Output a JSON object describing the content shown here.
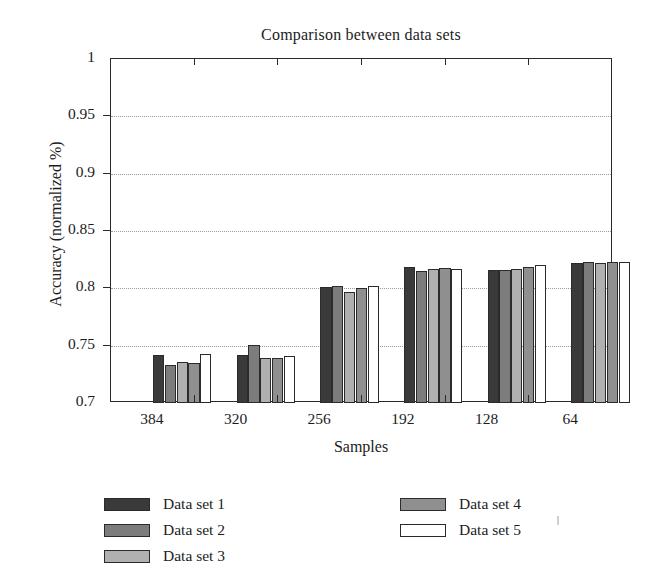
{
  "chart_data": {
    "type": "bar",
    "title": "Comparison between data sets",
    "xlabel": "Samples",
    "ylabel": "Accuracy (normalized %)",
    "categories": [
      "384",
      "320",
      "256",
      "192",
      "128",
      "64"
    ],
    "ylim": [
      0.7,
      1
    ],
    "yticks": [
      0.7,
      0.75,
      0.8,
      0.85,
      0.9,
      0.95,
      1
    ],
    "ytick_labels": [
      "0.7",
      "0.75",
      "0.8",
      "0.85",
      "0.9",
      "0.95",
      "1"
    ],
    "grid": true,
    "legend_position": "below-left",
    "series": [
      {
        "name": "Data set 1",
        "color": "#3a3a3a",
        "values": [
          0.742,
          0.742,
          0.801,
          0.819,
          0.816,
          0.822
        ]
      },
      {
        "name": "Data set 2",
        "color": "#7c7c7c",
        "values": [
          0.733,
          0.751,
          0.802,
          0.815,
          0.816,
          0.823
        ]
      },
      {
        "name": "Data set 3",
        "color": "#b0b0b0",
        "values": [
          0.736,
          0.739,
          0.797,
          0.817,
          0.817,
          0.822
        ]
      },
      {
        "name": "Data set 4",
        "color": "#8f8f8f",
        "values": [
          0.735,
          0.739,
          0.8,
          0.818,
          0.819,
          0.823
        ]
      },
      {
        "name": "Data set 5",
        "color": "#ffffff",
        "values": [
          0.743,
          0.741,
          0.802,
          0.817,
          0.82,
          0.823
        ]
      }
    ]
  },
  "legend": {
    "columns": [
      [
        "Data set 1",
        "Data set 2",
        "Data set 3"
      ],
      [
        "Data set 4",
        "Data set 5"
      ]
    ]
  }
}
